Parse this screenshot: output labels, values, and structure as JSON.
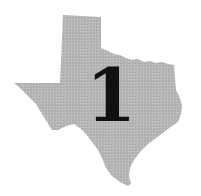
{
  "map": {
    "region": "Texas",
    "fill_color": "#b3b3b3",
    "background": "#ffffff",
    "label": "1",
    "label_color": "#111111"
  }
}
